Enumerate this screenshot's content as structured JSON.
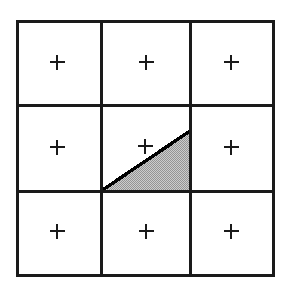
{
  "figure": {
    "title": "Three-by-three grid of square cells with a shaded right triangle in the center cell",
    "caption": "",
    "background_color": "#ffffff",
    "canvas": {
      "width": 289,
      "height": 292
    }
  },
  "grid": {
    "name": "3x3-square-grid",
    "rows": 3,
    "columns": 3,
    "stroke_color": "#1a1a1a",
    "outer_stroke_width": 3,
    "inner_stroke_width": 3,
    "cell_fill": "#ffffff",
    "bounds": {
      "x": 17,
      "y": 21,
      "width": 256,
      "height": 254
    },
    "vertical_line_x": [
      101,
      190
    ],
    "horizontal_line_y": [
      105,
      191
    ],
    "cells": [
      {
        "id": "cell-r1c1",
        "row": 1,
        "column": 1,
        "marker": "+",
        "marker_x": 57,
        "marker_y": 62,
        "shaded": false
      },
      {
        "id": "cell-r1c2",
        "row": 1,
        "column": 2,
        "marker": "+",
        "marker_x": 146,
        "marker_y": 62,
        "shaded": false
      },
      {
        "id": "cell-r1c3",
        "row": 1,
        "column": 3,
        "marker": "+",
        "marker_x": 231,
        "marker_y": 62,
        "shaded": false
      },
      {
        "id": "cell-r2c1",
        "row": 2,
        "column": 1,
        "marker": "+",
        "marker_x": 57,
        "marker_y": 147,
        "shaded": false
      },
      {
        "id": "cell-r2c2",
        "row": 2,
        "column": 2,
        "marker": "+",
        "marker_x": 145,
        "marker_y": 146,
        "shaded": true
      },
      {
        "id": "cell-r2c3",
        "row": 2,
        "column": 3,
        "marker": "+",
        "marker_x": 231,
        "marker_y": 147,
        "shaded": false
      },
      {
        "id": "cell-r3c1",
        "row": 3,
        "column": 1,
        "marker": "+",
        "marker_x": 57,
        "marker_y": 231,
        "shaded": false
      },
      {
        "id": "cell-r3c2",
        "row": 3,
        "column": 2,
        "marker": "+",
        "marker_x": 146,
        "marker_y": 231,
        "shaded": false
      },
      {
        "id": "cell-r3c3",
        "row": 3,
        "column": 3,
        "marker": "+",
        "marker_x": 231,
        "marker_y": 231,
        "shaded": false
      }
    ]
  },
  "markers": {
    "glyph": "+",
    "arm_length": 15,
    "stroke_width": 1.6,
    "color": "#1a1a1a"
  },
  "triangle": {
    "name": "shaded-right-triangle",
    "in_cell": "cell-r2c2",
    "shape": "right triangle",
    "fill_color": "#b4b4b4",
    "fill_pattern": "checkerboard-dither",
    "stroke_color": "#000000",
    "hypotenuse_stroke_width": 3,
    "vertices": [
      {
        "label": "bottom-left",
        "x": 101,
        "y": 191
      },
      {
        "label": "bottom-right",
        "x": 190,
        "y": 191
      },
      {
        "label": "top-right-apex",
        "x": 190,
        "y": 131
      }
    ]
  }
}
